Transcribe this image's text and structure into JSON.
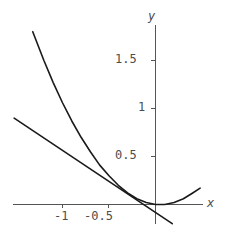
{
  "figure": {
    "background_color": "#ffffff",
    "axis_color": "#555555",
    "curve_color": "#1a1a1a"
  },
  "axes": {
    "x_label": "x",
    "y_label": "y",
    "x_ticks": [
      {
        "label": "-1",
        "value": -1
      },
      {
        "label": "-0.5",
        "value": -0.5
      }
    ],
    "y_ticks": [
      {
        "label": "0.5",
        "value": 0.5
      },
      {
        "label": "1",
        "value": 1
      },
      {
        "label": "1.5",
        "value": 1.5
      }
    ]
  },
  "chart_data": {
    "type": "line",
    "title": "",
    "xlabel": "x",
    "ylabel": "y",
    "xlim": [
      -1.53,
      0.78
    ],
    "ylim": [
      -0.21,
      1.86
    ],
    "grid": false,
    "legend": null,
    "x_ticks": [
      -1,
      -0.5
    ],
    "x_tick_labels": [
      "-1",
      "-0.5"
    ],
    "y_ticks": [
      0.5,
      1,
      1.5
    ],
    "y_tick_labels": [
      "0.5",
      "1",
      "1.5"
    ],
    "series": [
      {
        "name": "parabola",
        "type": "line",
        "color": "#1a1a1a",
        "x": [
          -1.32,
          -1.2,
          -1.1,
          -1.0,
          -0.9,
          -0.8,
          -0.7,
          -0.6,
          -0.5,
          -0.4,
          -0.3,
          -0.2,
          -0.1,
          0.0,
          0.1,
          0.2,
          0.3,
          0.4,
          0.48
        ],
        "y": [
          1.8,
          1.5,
          1.27,
          1.06,
          0.87,
          0.7,
          0.55,
          0.41,
          0.3,
          0.2,
          0.12,
          0.06,
          0.02,
          0.0,
          0.0,
          0.02,
          0.06,
          0.12,
          0.17
        ]
      },
      {
        "name": "tangent-line",
        "type": "line",
        "color": "#1a1a1a",
        "x": [
          -1.52,
          0.18
        ],
        "y": [
          0.9,
          -0.2
        ]
      }
    ],
    "annotations": [
      {
        "text": "x",
        "kind": "axis-label",
        "position": "right-of-x-axis"
      },
      {
        "text": "y",
        "kind": "axis-label",
        "position": "above-y-axis"
      }
    ]
  }
}
